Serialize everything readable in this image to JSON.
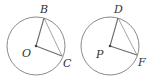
{
  "figures": [
    {
      "name": "circle-O",
      "center": {
        "label": "O",
        "x": 36,
        "y": 46
      },
      "radius": 29,
      "points": [
        {
          "label": "B",
          "x": 44,
          "y": 18
        },
        {
          "label": "C",
          "x": 62,
          "y": 56
        }
      ],
      "segments": [
        "OB",
        "OC",
        "BC"
      ],
      "label_positions": {
        "B": {
          "x": 40,
          "y": 13
        },
        "O": {
          "x": 22,
          "y": 57
        },
        "C": {
          "x": 63,
          "y": 67
        }
      }
    },
    {
      "name": "circle-P",
      "center": {
        "label": "P",
        "x": 110,
        "y": 46
      },
      "radius": 29,
      "points": [
        {
          "label": "D",
          "x": 118,
          "y": 18
        },
        {
          "label": "F",
          "x": 137,
          "y": 55
        }
      ],
      "segments": [
        "PD",
        "PF",
        "DF"
      ],
      "label_positions": {
        "D": {
          "x": 114,
          "y": 13
        },
        "P": {
          "x": 96,
          "y": 58
        },
        "F": {
          "x": 138,
          "y": 66
        }
      }
    }
  ],
  "labels": {
    "B": "B",
    "O": "O",
    "C": "C",
    "D": "D",
    "P": "P",
    "F": "F"
  },
  "colors": {
    "circle_stroke": "#8a8a8a",
    "radius_stroke": "#6a6a6a",
    "chord_stroke": "#9a9a9a",
    "label": "#333333"
  }
}
